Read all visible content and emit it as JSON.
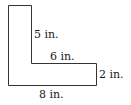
{
  "diagram": {
    "shape": "L-shape",
    "stroke_color": "#333333",
    "labels": {
      "inner_vertical": "5 in.",
      "inner_horizontal": "6 in.",
      "right_side": "2 in.",
      "bottom": "8 in."
    }
  }
}
